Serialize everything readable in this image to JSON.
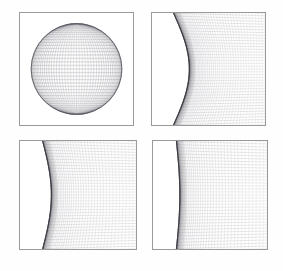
{
  "figure": {
    "background_color": "#fefefe",
    "border_color": "#9a9a9a",
    "mesh_color": "#8a8a94",
    "limb_color": "#2b2b33",
    "width": 283,
    "height": 271,
    "panel_count": 4,
    "layout": "2x2"
  },
  "chart_data": {
    "type": "line",
    "subtitle": "Wireframe sphere rendered as latitude-longitude quadrilateral mesh, shown at four successive magnifications of the left limb",
    "xlabel": "",
    "ylabel": "",
    "grid": true,
    "legend": "none",
    "series": [
      {
        "name": "panel-1-full-sphere",
        "zoom_factor": 1,
        "description": "Complete sphere with latitude-longitude wireframe mesh centered in frame",
        "sphere_center_x": 0.5,
        "sphere_center_y": 0.5,
        "sphere_radius": 0.405,
        "meridian_count": 48,
        "parallel_count": 40,
        "limb_visible": "full-circle"
      },
      {
        "name": "panel-2-zoom-4x",
        "zoom_factor": 4,
        "description": "Left limb of the sphere magnified, strong arc curvature",
        "limb_apex_x": 0.33,
        "limb_top_x": 0.19,
        "limb_bottom_x": 0.19,
        "meridian_count": 44,
        "parallel_count": 40,
        "limb_visible": "left-arc"
      },
      {
        "name": "panel-3-zoom-16x",
        "zoom_factor": 16,
        "description": "Limb magnified further, arc flattening toward vertical, mesh compresses at edge",
        "limb_apex_x": 0.27,
        "limb_top_x": 0.195,
        "limb_bottom_x": 0.195,
        "meridian_count": 40,
        "parallel_count": 38,
        "limb_visible": "left-arc"
      },
      {
        "name": "panel-4-zoom-64x",
        "zoom_factor": 64,
        "description": "Limb nearly vertical with dense dark accumulation of converging meridians",
        "limb_apex_x": 0.235,
        "limb_top_x": 0.205,
        "limb_bottom_x": 0.205,
        "meridian_count": 38,
        "parallel_count": 36,
        "limb_visible": "left-edge"
      }
    ],
    "axis_ranges": {
      "x": [
        0,
        1
      ],
      "y": [
        0,
        1
      ]
    }
  },
  "panels": [
    {
      "id": "panel-1",
      "name": "full-sphere",
      "caption": ""
    },
    {
      "id": "panel-2",
      "name": "limb-zoom-1",
      "caption": ""
    },
    {
      "id": "panel-3",
      "name": "limb-zoom-2",
      "caption": ""
    },
    {
      "id": "panel-4",
      "name": "limb-zoom-3",
      "caption": ""
    }
  ]
}
